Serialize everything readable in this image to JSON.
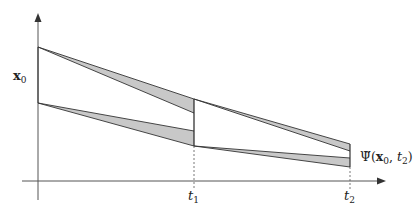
{
  "diagram": {
    "type": "flow-map-error-bands",
    "colors": {
      "axis": "#555555",
      "line": "#333333",
      "band_fill": "#c8c8c8",
      "dotted": "#555555"
    },
    "axes": {
      "origin": [
        38,
        181
      ],
      "x_end": 385,
      "y_top": 14
    },
    "labels": {
      "y_label_main": "x",
      "y_label_sub": "0",
      "t1_main": "t",
      "t1_sub": "1",
      "t2_main": "t",
      "t2_sub": "2",
      "psi_label": "Ψ̃(",
      "psi_x": "x",
      "psi_x_sub": "0",
      "psi_sep": ", ",
      "psi_t": "t",
      "psi_t_sub": "2",
      "psi_close": ")"
    },
    "ticks": {
      "t1_x": 194,
      "t2_x": 350
    },
    "segments": [
      {
        "name": "upper-band-segment-1",
        "start": [
          38,
          47
        ],
        "end_outer": [
          194,
          99
        ],
        "end_inner": [
          194,
          113
        ]
      },
      {
        "name": "lower-band-segment-1",
        "start": [
          38,
          103
        ],
        "end_outer": [
          194,
          146
        ],
        "end_inner": [
          194,
          131
        ]
      },
      {
        "name": "upper-band-segment-2",
        "start": [
          194,
          99
        ],
        "end_outer": [
          350,
          144
        ],
        "end_inner": [
          350,
          151
        ]
      },
      {
        "name": "lower-band-segment-2",
        "start": [
          194,
          146
        ],
        "end_outer": [
          350,
          167
        ],
        "end_inner": [
          350,
          158
        ]
      }
    ]
  }
}
